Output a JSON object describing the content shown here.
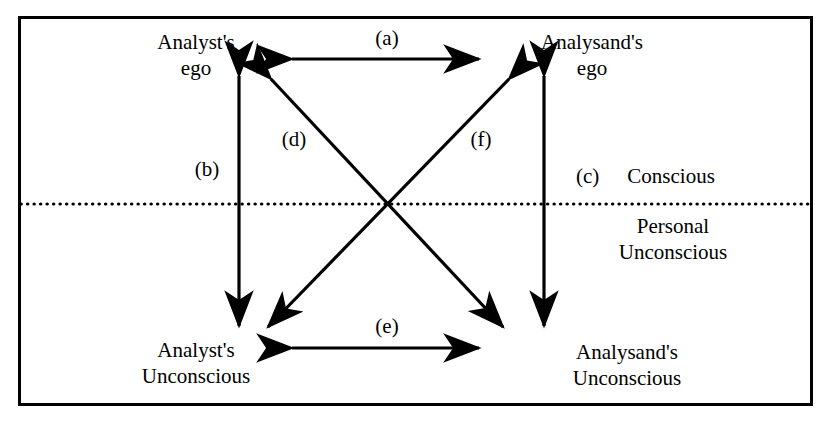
{
  "figure": {
    "kind": "psychoanalytic-transference-diagram",
    "border_color": "#000000",
    "line_color": "#000000",
    "background_color": "#ffffff",
    "divider_style": "dotted"
  },
  "nodes": {
    "analyst_ego": {
      "line1": "Analyst's",
      "line2": "ego"
    },
    "analysand_ego": {
      "line1": "Analysand's",
      "line2": "ego"
    },
    "analyst_unconscious": {
      "line1": "Analyst's",
      "line2": "Unconscious"
    },
    "analysand_unconscious": {
      "line1": "Analysand's",
      "line2": "Unconscious"
    }
  },
  "regions": {
    "conscious": "Conscious",
    "personal_unconscious": {
      "line1": "Personal",
      "line2": "Unconscious"
    }
  },
  "edges": {
    "a": "(a)",
    "b": "(b)",
    "c": "(c)",
    "d": "(d)",
    "e": "(e)",
    "f": "(f)"
  }
}
